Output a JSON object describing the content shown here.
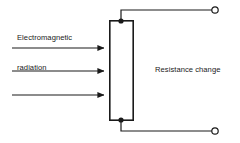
{
  "figure": {
    "type": "schematic-diagram",
    "background_color": "#ffffff",
    "stroke_color": "#1a1a1a"
  },
  "labels": {
    "input_label_line1": "Electromagnetic",
    "input_label_line2": "radiation",
    "output_label": "Resistance change"
  },
  "element": {
    "name": "sensing-element-rectangle",
    "x": 109,
    "y": 20,
    "width": 24,
    "height": 101,
    "fill": "#ffffff",
    "stroke": "#1a1a1a",
    "stroke_width": 1.6
  },
  "arrows": [
    {
      "name": "radiation-arrow-1",
      "x1": 12,
      "y1": 48,
      "x2": 107,
      "y2": 48
    },
    {
      "name": "radiation-arrow-2",
      "x1": 12,
      "y1": 71,
      "x2": 107,
      "y2": 71
    },
    {
      "name": "radiation-arrow-3",
      "x1": 12,
      "y1": 95,
      "x2": 107,
      "y2": 95
    }
  ],
  "junction_nodes": [
    {
      "name": "top-junction-node",
      "cx": 121,
      "cy": 21,
      "r": 2.6
    },
    {
      "name": "bottom-junction-node",
      "cx": 121,
      "cy": 120,
      "r": 2.6
    }
  ],
  "lead_wires": [
    {
      "name": "top-lead-wire",
      "points": "121,21 121,10 212,10"
    },
    {
      "name": "bottom-lead-wire",
      "points": "121,120 121,131 212,131"
    }
  ],
  "terminals": [
    {
      "name": "top-terminal",
      "cx": 215,
      "cy": 10,
      "r": 3.2
    },
    {
      "name": "bottom-terminal",
      "cx": 215,
      "cy": 131,
      "r": 3.2
    }
  ]
}
